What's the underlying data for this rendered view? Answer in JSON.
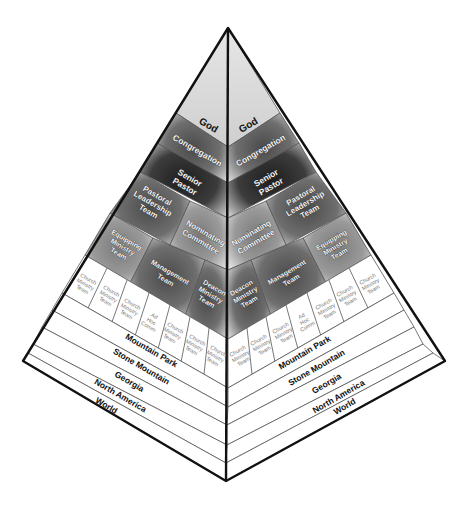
{
  "diagram": {
    "colors": {
      "outline": "#111111",
      "divider": "#555555",
      "god_fill": "#d9d9d9",
      "tier_dark": "#3a3a3a",
      "tier_mid": "#6a6a6a",
      "tier_light": "#8c8c8c",
      "white_band": "#ffffff"
    },
    "left_face": {
      "god": "God",
      "congregation": "Congregation",
      "senior_pastor": [
        "Senior",
        "Pastor"
      ],
      "pastoral_leadership_team": [
        "Pastoral",
        "Leadership",
        "Team"
      ],
      "nominating_committee": [
        "Nominating",
        "Committee"
      ],
      "equipping_ministry_team": [
        "Equipping",
        "Ministry",
        "Team"
      ],
      "management_team": [
        "Management",
        "Team"
      ],
      "deacon_ministry_team": [
        "Deacon",
        "Ministry",
        "Team"
      ],
      "church_row": [
        [
          "Church",
          "Ministry",
          "Team"
        ],
        [
          "Church",
          "Ministry",
          "Team"
        ],
        [
          "Church",
          "Ministry",
          "Team"
        ],
        [
          "Ad",
          "Hoc",
          "Comm"
        ],
        [
          "Church",
          "Ministry",
          "Team"
        ],
        [
          "Church",
          "Ministry",
          "Team"
        ],
        [
          "Church",
          "Ministry",
          "Team"
        ]
      ],
      "geo_bands": [
        "Mountain Park",
        "Stone Mountain",
        "Georgia",
        "North America",
        "World"
      ]
    },
    "right_face": {
      "god": "God",
      "congregation": "Congregation",
      "senior_pastor": [
        "Senior",
        "Pastor"
      ],
      "pastoral_leadership_team": [
        "Pastoral",
        "Leadership",
        "Team"
      ],
      "nominating_committee": [
        "Nominating",
        "Committee"
      ],
      "equipping_ministry_team": [
        "Equipping",
        "Ministry",
        "Team"
      ],
      "management_team": [
        "Management",
        "Team"
      ],
      "deacon_ministry_team": [
        "Deacon",
        "Ministry",
        "Team"
      ],
      "church_row": [
        [
          "Church",
          "Ministry",
          "Team"
        ],
        [
          "Church",
          "Ministry",
          "Team"
        ],
        [
          "Church",
          "Ministry",
          "Team"
        ],
        [
          "Ad",
          "Hoc",
          "Comm"
        ],
        [
          "Church",
          "Ministry",
          "Team"
        ],
        [
          "Church",
          "Ministry",
          "Team"
        ],
        [
          "Church",
          "Ministry",
          "Team"
        ]
      ],
      "geo_bands": [
        "Mountain Park",
        "Stone Mountain",
        "Georgia",
        "North America",
        "World"
      ]
    }
  }
}
